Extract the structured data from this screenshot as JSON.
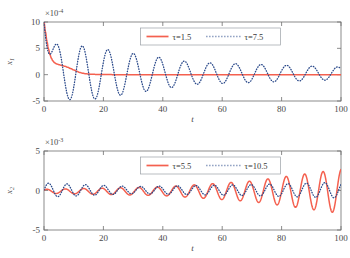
{
  "figure": {
    "type": "multi-panel-line-chart",
    "background": "#ffffff",
    "panels": 2
  },
  "colors": {
    "series_solid": "#f4604f",
    "series_dotted": "#2b4a8b",
    "axis": "#6f6f6f",
    "text": "#3a3a3a",
    "legend_border": "#9aa0a6"
  },
  "chart_data": [
    {
      "id": "top",
      "type": "line",
      "title": "",
      "xlabel": "t",
      "ylabel": "x",
      "ylabel_sub": "1",
      "y_exponent_text": "×10",
      "y_exponent_sup": "-4",
      "xlim": [
        0,
        100
      ],
      "ylim": [
        -5,
        10
      ],
      "xticks": [
        0,
        20,
        40,
        60,
        80,
        100
      ],
      "xticklabels": [
        "0",
        "20",
        "40",
        "60",
        "80",
        "100"
      ],
      "yticks": [
        -5,
        0,
        5,
        10
      ],
      "yticklabels": [
        "-5",
        "0",
        "5",
        "10"
      ],
      "grid": false,
      "legend_position": "top-center",
      "series": [
        {
          "name": "τ=1.5",
          "style": "solid",
          "color": "#f4604f",
          "x": [
            0,
            0.5,
            1,
            1.5,
            2,
            2.5,
            3,
            3.5,
            4,
            4.5,
            5,
            6,
            7,
            8,
            9,
            10,
            11,
            12,
            13,
            14,
            15,
            16,
            18,
            20,
            25,
            30,
            35,
            40,
            45,
            50,
            55,
            60,
            65,
            70,
            75,
            80,
            85,
            90,
            95,
            100
          ],
          "y": [
            10,
            8.1,
            6.3,
            4.9,
            3.8,
            3.1,
            2.6,
            2.3,
            2.1,
            2.0,
            1.9,
            1.75,
            1.6,
            1.4,
            1.15,
            0.9,
            0.65,
            0.42,
            0.28,
            0.18,
            0.12,
            0.08,
            0.04,
            0.02,
            0.0,
            -0.02,
            -0.02,
            -0.01,
            0.0,
            0.0,
            0.0,
            0.0,
            0.0,
            0.0,
            0.0,
            0.0,
            0.0,
            0.0,
            0.0,
            0.0
          ]
        },
        {
          "name": "τ=7.5",
          "style": "dotted",
          "color": "#2b4a8b",
          "description": "decaying oscillation, period about 8.6, initial value 10, amplitude decays slowly to about 1.2 by t=100",
          "model": {
            "kind": "damped-sine-plus-decay",
            "initial": 10,
            "period": 8.6,
            "amplitude_at_t10": 5.5,
            "amplitude_at_t50": 2.1,
            "amplitude_at_t100": 1.2,
            "phase_offset": 0.0,
            "offset": 0.25
          }
        }
      ]
    },
    {
      "id": "bottom",
      "type": "line",
      "title": "",
      "xlabel": "t",
      "ylabel": "x",
      "ylabel_sub": "2",
      "y_exponent_text": "×10",
      "y_exponent_sup": "-3",
      "xlim": [
        0,
        100
      ],
      "ylim": [
        -5,
        5
      ],
      "xticks": [
        0,
        20,
        40,
        60,
        80,
        100
      ],
      "xticklabels": [
        "0",
        "20",
        "40",
        "60",
        "80",
        "100"
      ],
      "yticks": [
        -5,
        0,
        5
      ],
      "yticklabels": [
        "-5",
        "0",
        "5"
      ],
      "grid": false,
      "legend_position": "top-center",
      "series": [
        {
          "name": "τ=5.5",
          "style": "solid",
          "color": "#f4604f",
          "description": "growing oscillation, period about 6.2, amplitude grows from about 0.2 at t=0 to about 2.8 at t=100",
          "model": {
            "kind": "growing-sine",
            "period": 6.2,
            "amplitude_at_t0": 0.25,
            "amplitude_at_t40": 0.55,
            "amplitude_at_t70": 1.3,
            "amplitude_at_t100": 2.8,
            "phase_offset": 0.6,
            "offset": -0.1
          }
        },
        {
          "name": "τ=10.5",
          "style": "dotted",
          "color": "#2b4a8b",
          "description": "small bounded oscillation, period about 6.2, amplitude roughly 0.45 to 1.0",
          "model": {
            "kind": "bounded-sine",
            "period": 6.2,
            "amplitude_at_t0": 0.9,
            "amplitude_at_t30": 0.45,
            "amplitude_at_t70": 0.7,
            "amplitude_at_t100": 1.0,
            "phase_offset": 0.0,
            "offset": 0.05
          }
        }
      ]
    }
  ]
}
